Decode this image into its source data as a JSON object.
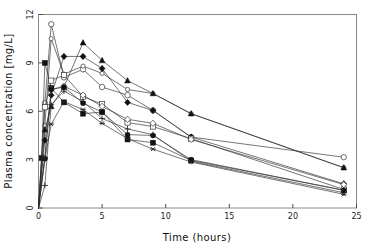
{
  "figure": {
    "background": "#ffffff",
    "frame_color": "#8a8a8a",
    "line_color": "#2b2b2b",
    "title_partial": ""
  },
  "axes": {
    "x_title": "Time (hours)",
    "y_title": "Plasma concentration [mg/L]",
    "x_ticks": [
      "0",
      "5",
      "10",
      "15",
      "20",
      "25"
    ],
    "y_ticks": [
      "0",
      "3",
      "6",
      "9",
      "12"
    ]
  },
  "chart_data": {
    "type": "line",
    "title": "",
    "xlabel": "Time (hours)",
    "ylabel": "Plasma concentration [mg/L]",
    "xlim": [
      0,
      25
    ],
    "ylim": [
      0,
      12
    ],
    "x_ticks": [
      0,
      5,
      10,
      15,
      20,
      25
    ],
    "y_ticks": [
      0,
      3,
      6,
      9,
      12
    ],
    "grid": false,
    "legend": "none",
    "x_unit": "hours",
    "y_unit": "mg/L",
    "n_series": 10,
    "sampling_times": [
      0,
      0.25,
      0.5,
      0.75,
      1,
      1.5,
      2,
      3.5,
      5,
      7,
      9,
      12,
      24
    ],
    "series": [
      {
        "name": "subject-1",
        "marker": "open-circle",
        "x": [
          0,
          0.5,
          1,
          2,
          3.5,
          5,
          7,
          9,
          12,
          24
        ],
        "values": [
          0,
          6.5,
          11.4,
          8.1,
          8.6,
          7.5,
          7.0,
          6.05,
          4.4,
          3.15
        ]
      },
      {
        "name": "subject-2",
        "marker": "open-circle-small",
        "x": [
          0,
          0.5,
          1,
          2,
          3.5,
          5,
          7,
          9,
          12,
          24
        ],
        "values": [
          0,
          5.1,
          10.5,
          8.3,
          8.8,
          8.35,
          7.35,
          7.1,
          5.85,
          2.5
        ]
      },
      {
        "name": "subject-3",
        "marker": "filled-triangle",
        "x": [
          0,
          0.5,
          1,
          2,
          3.5,
          5,
          7,
          9,
          12,
          24
        ],
        "values": [
          0,
          4.85,
          6.3,
          7.5,
          10.25,
          9.15,
          7.9,
          7.1,
          5.85,
          2.5
        ]
      },
      {
        "name": "subject-4",
        "marker": "filled-diamond",
        "x": [
          0,
          0.5,
          1,
          2,
          3.5,
          5,
          7,
          9,
          12,
          24
        ],
        "values": [
          0,
          4.2,
          7.0,
          9.4,
          9.4,
          8.65,
          6.55,
          6.05,
          4.4,
          1.5
        ]
      },
      {
        "name": "subject-5",
        "marker": "filled-square",
        "x": [
          0,
          0.25,
          0.5,
          1,
          2,
          3.5,
          5,
          7,
          9,
          12,
          24
        ],
        "values": [
          0,
          3.1,
          9.0,
          7.45,
          6.55,
          5.85,
          5.95,
          4.25,
          4.05,
          2.95,
          1.1
        ]
      },
      {
        "name": "subject-6",
        "marker": "open-square",
        "x": [
          0,
          0.5,
          1,
          2,
          3.5,
          5,
          7,
          9,
          12,
          24
        ],
        "values": [
          0,
          6.25,
          7.9,
          8.25,
          6.9,
          6.45,
          5.3,
          5.05,
          4.3,
          1.15
        ]
      },
      {
        "name": "subject-7",
        "marker": "open-diamond",
        "x": [
          0,
          0.5,
          1,
          2,
          3.5,
          5,
          7,
          9,
          12,
          24
        ],
        "values": [
          0,
          3.1,
          7.35,
          7.55,
          7.0,
          6.3,
          5.5,
          5.25,
          4.25,
          1.45
        ]
      },
      {
        "name": "subject-8",
        "marker": "plus",
        "x": [
          0,
          0.5,
          1,
          2,
          3.5,
          5,
          7,
          9,
          12,
          24
        ],
        "values": [
          0,
          1.4,
          6.4,
          7.25,
          6.6,
          5.55,
          4.9,
          4.55,
          2.9,
          0.95
        ]
      },
      {
        "name": "subject-9",
        "marker": "filled-circle",
        "x": [
          0,
          0.5,
          1,
          2,
          3.5,
          5,
          7,
          9,
          12,
          24
        ],
        "values": [
          0,
          3.05,
          7.35,
          7.5,
          6.5,
          5.95,
          4.55,
          4.5,
          3.0,
          1.1
        ]
      },
      {
        "name": "subject-10",
        "marker": "open-star",
        "x": [
          0,
          0.5,
          1,
          2,
          3.5,
          5,
          7,
          9,
          12,
          24
        ],
        "values": [
          0,
          3.05,
          5.2,
          6.6,
          6.1,
          5.25,
          4.3,
          3.65,
          2.85,
          0.85
        ]
      }
    ]
  }
}
